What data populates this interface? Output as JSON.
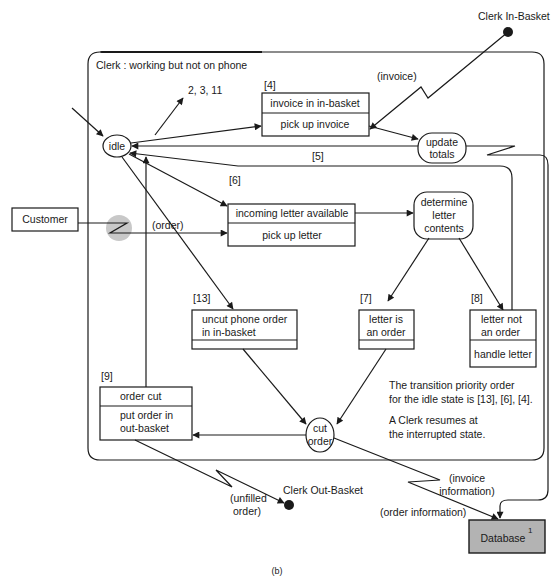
{
  "frame": {
    "title": "Clerk : working but not on phone",
    "caption": "(b)"
  },
  "external": {
    "clerk_in_basket": "Clerk In-Basket",
    "clerk_out_basket": "Clerk Out-Basket",
    "customer": "Customer",
    "database": "Database",
    "database_superscript": "1",
    "colors": {
      "database_fill": "#b3b3b3",
      "signal_marker": "#c8c8c8"
    }
  },
  "states": {
    "idle": "idle",
    "update_totals": [
      "update",
      "totals"
    ],
    "determine_letter_contents": [
      "determine",
      "letter",
      "contents"
    ],
    "cut_order": [
      "cut",
      "order"
    ]
  },
  "transitions": {
    "t4": {
      "id": "[4]",
      "event": "invoice in in-basket",
      "action": "pick up invoice"
    },
    "t5": {
      "id": "[5]"
    },
    "t6": {
      "id": "[6]",
      "event": "incoming letter available",
      "action": "pick up letter"
    },
    "t7": {
      "id": "[7]",
      "event": [
        "letter is",
        "an order"
      ],
      "action": ""
    },
    "t8": {
      "id": "[8]",
      "event": [
        "letter not",
        "an order"
      ],
      "action": "handle letter"
    },
    "t9": {
      "id": "[9]",
      "event": "order cut",
      "action": [
        "put order in",
        "out-basket"
      ]
    },
    "t13": {
      "id": "[13]",
      "event": [
        "uncut phone order",
        "in in-basket"
      ],
      "action": ""
    },
    "other_transitions": "2, 3, 11"
  },
  "signals": {
    "invoice": "(invoice)",
    "order": "(order)",
    "unfilled_order": [
      "(unfilled",
      "order)"
    ],
    "order_information": "(order information)",
    "invoice_information": [
      "(invoice",
      "information)"
    ]
  },
  "notes": {
    "priority": [
      "The transition priority order",
      "for the idle state is [13], [6], [4]."
    ],
    "resume": [
      "A Clerk resumes at",
      "the interrupted state."
    ]
  }
}
